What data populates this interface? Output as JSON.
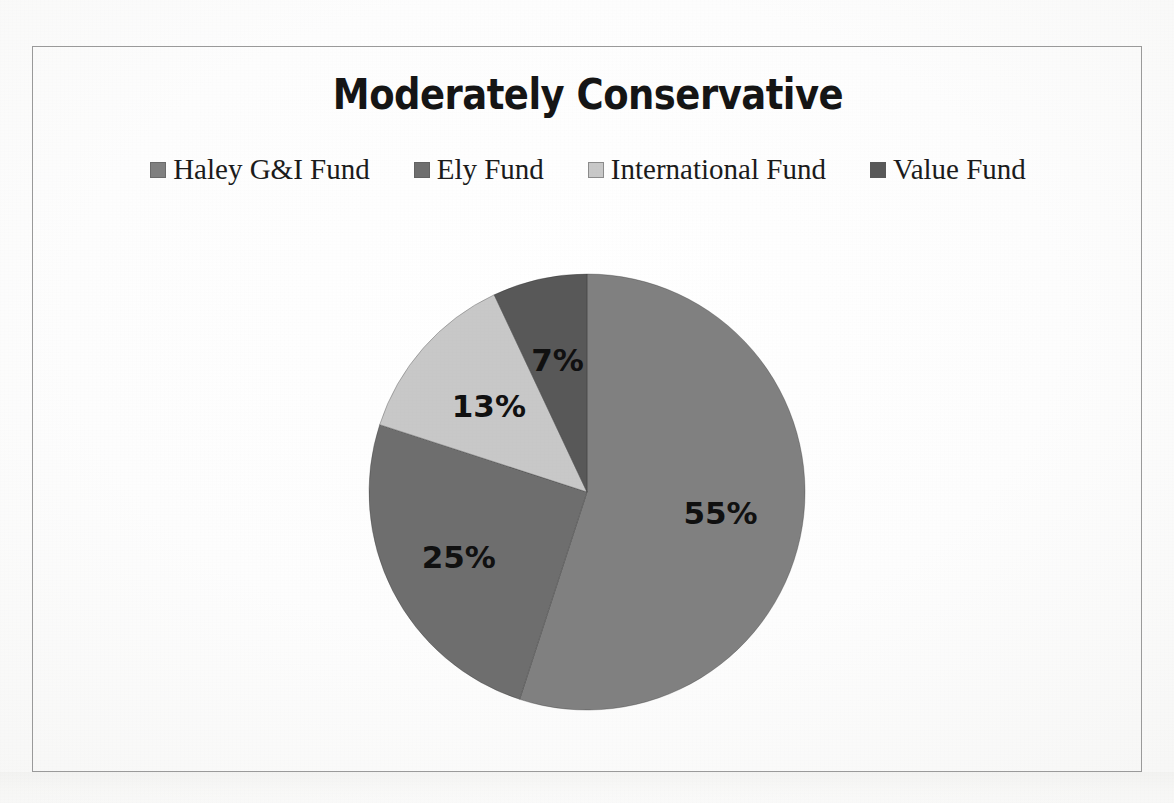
{
  "document": {
    "kind": "scanned-chart-page",
    "background_color": "#fdfdfd"
  },
  "chart": {
    "title": "Moderately Conservative",
    "frame_border_color": "#9a9a9a",
    "legend": {
      "position": "top",
      "items": [
        {
          "label": "Haley G&I Fund",
          "color": "#808080"
        },
        {
          "label": "Ely Fund",
          "color": "#6e6e6e"
        },
        {
          "label": "International Fund",
          "color": "#c8c8c8"
        },
        {
          "label": "Value Fund",
          "color": "#585858"
        }
      ]
    }
  },
  "chart_data": {
    "type": "pie",
    "title": "Moderately Conservative",
    "xlabel": "",
    "ylabel": "",
    "categories": [
      "Haley G&I Fund",
      "Ely Fund",
      "International Fund",
      "Value Fund"
    ],
    "values": [
      55,
      25,
      13,
      7
    ],
    "value_unit": "%",
    "data_labels": [
      "55%",
      "25%",
      "13%",
      "7%"
    ],
    "colors": [
      "#808080",
      "#6e6e6e",
      "#c8c8c8",
      "#585858"
    ],
    "start_angle_deg": 0,
    "direction": "clockwise",
    "legend_position": "top",
    "grid": false,
    "total": 100
  }
}
